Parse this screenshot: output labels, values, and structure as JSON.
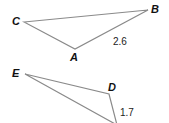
{
  "figure": {
    "triangle_abc": {
      "vertices": {
        "A": {
          "label": "A",
          "x": 75,
          "y": 49
        },
        "B": {
          "label": "B",
          "x": 148,
          "y": 10
        },
        "C": {
          "label": "C",
          "x": 24,
          "y": 22
        }
      },
      "side_label": {
        "side": "AB",
        "text": "2.6"
      }
    },
    "triangle_def": {
      "vertices": {
        "D": {
          "label": "D",
          "x": 109,
          "y": 94
        },
        "E": {
          "label": "E",
          "x": 25,
          "y": 74
        },
        "F": {
          "label": "",
          "x": 117,
          "y": 123
        }
      },
      "side_label": {
        "side": "DF",
        "text": "1.7"
      }
    },
    "colors": {
      "edge": "#8a8a8a",
      "label": "#111111"
    }
  }
}
